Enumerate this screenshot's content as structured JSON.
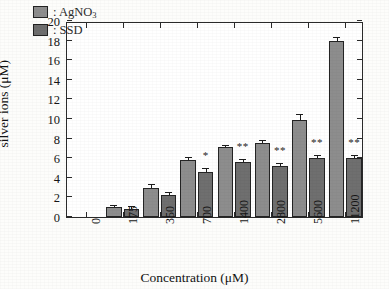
{
  "chart_data": {
    "type": "bar",
    "title": "",
    "xlabel": "Concentration (μM)",
    "ylabel": "silver ions (μM)",
    "categories": [
      "0",
      "175",
      "350",
      "700",
      "1400",
      "2800",
      "5600",
      "11200"
    ],
    "ylim": [
      0,
      20
    ],
    "ytick_step": 2,
    "yticks": [
      "20",
      "18",
      "16",
      "14",
      "12",
      "10",
      "8",
      "6",
      "4",
      "2",
      "0"
    ],
    "grid": false,
    "legend_position": "top-left",
    "series": [
      {
        "name": ": AgNO3",
        "label_html": ": AgNO",
        "label_sub": "3",
        "color": "#8d8d8d",
        "values": [
          0,
          1.0,
          3.0,
          5.8,
          7.1,
          7.6,
          9.95,
          17.95
        ],
        "errors": [
          0,
          0.15,
          0.3,
          0.25,
          0.18,
          0.2,
          0.45,
          0.35
        ]
      },
      {
        "name": ": SSD",
        "label_html": ": SSD",
        "label_sub": "",
        "color": "#6f6f6f",
        "values": [
          0,
          0.85,
          2.2,
          4.6,
          5.65,
          5.2,
          6.0,
          6.0
        ],
        "errors": [
          0,
          0.2,
          0.25,
          0.25,
          0.2,
          0.22,
          0.18,
          0.25
        ]
      }
    ],
    "annotations": [
      {
        "category": "700",
        "text": "*",
        "series": 1
      },
      {
        "category": "1400",
        "text": "**",
        "series": 1
      },
      {
        "category": "2800",
        "text": "**",
        "series": 1
      },
      {
        "category": "5600",
        "text": "**",
        "series": 1
      },
      {
        "category": "11200",
        "text": "**",
        "series": 1
      }
    ]
  }
}
